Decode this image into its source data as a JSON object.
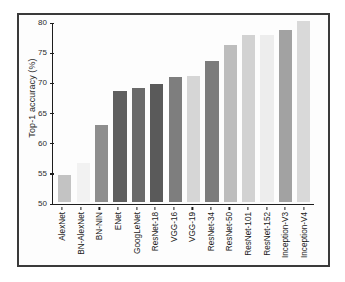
{
  "chart_data": {
    "type": "bar",
    "title": "",
    "xlabel": "",
    "ylabel": "Top-1 accuracy (%)",
    "ylim": [
      50,
      80
    ],
    "yticks": [
      50,
      55,
      60,
      65,
      70,
      75,
      80
    ],
    "ytick_labels": [
      "50",
      "55",
      "60",
      "65",
      "70",
      "75",
      "80"
    ],
    "grid": false,
    "legend": null,
    "categories": [
      "AlexNet",
      "BN-AlexNet",
      "BN-NIN",
      "ENet",
      "GoogLeNet",
      "ResNet-18",
      "VGG-16",
      "VGG-19",
      "ResNet-34",
      "ResNet-50",
      "ResNet-101",
      "ResNet-152",
      "Inception-V3",
      "Inception-V4"
    ],
    "values": [
      54.6,
      56.5,
      62.8,
      68.4,
      68.8,
      69.5,
      70.6,
      70.8,
      73.3,
      75.9,
      77.6,
      77.6,
      78.5,
      79.9
    ],
    "bar_colors": [
      "#c3c3c3",
      "#f2f2f2",
      "#8e8e8e",
      "#5f5f5f",
      "#6a6a6a",
      "#5a5a5a",
      "#7e7e7e",
      "#d6d6d6",
      "#7c7c7c",
      "#bdbdbd",
      "#d2d2d2",
      "#ededed",
      "#a2a2a2",
      "#d9d9d9"
    ]
  },
  "figure": {
    "frame_color": "#3a3a3a",
    "axis_color": "#1d1d1d",
    "background": "#fdfdfd"
  }
}
